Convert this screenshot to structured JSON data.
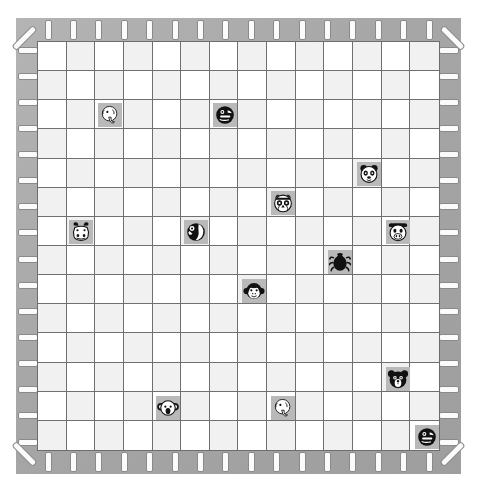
{
  "board": {
    "title": "Animal Grid Board",
    "grid": {
      "columns": 14,
      "rows": 14,
      "cell_size_px": 28.8,
      "shading": "checker",
      "shade_light": "#ffffff",
      "shade_dark": "#f1f1f1",
      "line_color": "#6f6f6f"
    },
    "frame": {
      "color": "#a8a8a8",
      "peg_color": "#fbfbfb",
      "peg_border": "#8a8a8a",
      "pegs_per_side": 16,
      "corner_pegs": 4
    },
    "tokens": [
      {
        "id": "t1",
        "animal": "elephant",
        "icon": "elephant-icon",
        "style": "light",
        "col": 2,
        "row": 2
      },
      {
        "id": "t2",
        "animal": "seal",
        "icon": "seal-icon",
        "style": "dark",
        "col": 6,
        "row": 2
      },
      {
        "id": "t3",
        "animal": "panda",
        "icon": "panda-icon",
        "style": "light",
        "col": 11,
        "row": 4
      },
      {
        "id": "t4",
        "animal": "owl",
        "icon": "owl-icon",
        "style": "light",
        "col": 8,
        "row": 5
      },
      {
        "id": "t5",
        "animal": "hippo",
        "icon": "hippo-icon",
        "style": "light",
        "col": 1,
        "row": 6
      },
      {
        "id": "t6",
        "animal": "parrot",
        "icon": "parrot-icon",
        "style": "dark",
        "col": 5,
        "row": 6
      },
      {
        "id": "t7",
        "animal": "cow",
        "icon": "cow-icon",
        "style": "light",
        "col": 12,
        "row": 6
      },
      {
        "id": "t8",
        "animal": "beetle",
        "icon": "beetle-icon",
        "style": "dark",
        "col": 10,
        "row": 7
      },
      {
        "id": "t9",
        "animal": "monkey",
        "icon": "monkey-icon",
        "style": "light",
        "col": 7,
        "row": 8
      },
      {
        "id": "t10",
        "animal": "bear",
        "icon": "bear-icon",
        "style": "dark",
        "col": 12,
        "row": 11
      },
      {
        "id": "t11",
        "animal": "koala",
        "icon": "koala-icon",
        "style": "light",
        "col": 4,
        "row": 12
      },
      {
        "id": "t12",
        "animal": "elephant",
        "icon": "elephant-icon",
        "style": "light",
        "col": 8,
        "row": 12
      },
      {
        "id": "t13",
        "animal": "seal",
        "icon": "seal-icon",
        "style": "dark",
        "col": 13,
        "row": 13
      }
    ],
    "token_count": 13,
    "tile_bg_color": "#b9b9b9"
  }
}
